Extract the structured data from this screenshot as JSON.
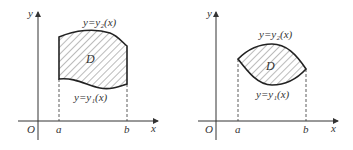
{
  "figures": [
    {
      "id": "left",
      "axis_y_label": "y",
      "axis_x_label": "x",
      "origin_label": "O",
      "a_label": "a",
      "b_label": "b",
      "region_label": "D",
      "upper_curve_label": "y=y₂(x)",
      "lower_curve_label": "y=y₁(x)"
    },
    {
      "id": "right",
      "axis_y_label": "y",
      "axis_x_label": "x",
      "origin_label": "O",
      "a_label": "a",
      "b_label": "b",
      "region_label": "D",
      "upper_curve_label": "y=y₂(x)",
      "lower_curve_label": "y=y₁(x)"
    }
  ],
  "colors": {
    "line": "#333333",
    "hatch": "#555555",
    "background": "#ffffff"
  }
}
